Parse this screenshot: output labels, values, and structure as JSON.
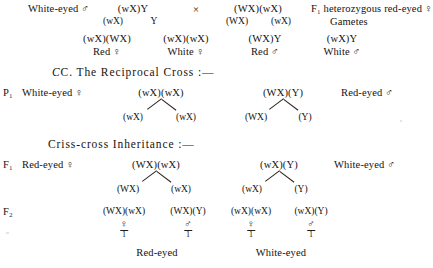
{
  "figure": {
    "caption_c": "C. The Reciprocal Cross :—",
    "caption_crisscross": "Criss-cross Inheritance :—",
    "symbols": {
      "male": "♂",
      "female": "♀",
      "cross": "×"
    }
  },
  "section_b_tail": {
    "parent_left_label": "White-eyed ♂",
    "parent_left_genotype": "(wX)Y",
    "parent_left_gametes": [
      "(wX)",
      "Y"
    ],
    "cross_symbol": "×",
    "parent_right_genotype": "(WX)(wX)",
    "parent_right_gametes": [
      "(WX)",
      "(wX)"
    ],
    "parent_right_label_line1": "F₁ heterozygous red-eyed ♀",
    "parent_right_label_line2": "Gametes",
    "offspring": [
      {
        "genotype": "(wX)(WX)",
        "phenotype": "Red ♀"
      },
      {
        "genotype": "(wX)(wX)",
        "phenotype": "White ♀"
      },
      {
        "genotype": "(WX)Y",
        "phenotype": "Red ♂"
      },
      {
        "genotype": "(wX)Y",
        "phenotype": "White ♂"
      }
    ]
  },
  "section_c": {
    "p1_row": {
      "generation_label": "P₁",
      "left_label": "White-eyed ♀",
      "left_genotype": "(wX)(wX)",
      "left_gametes": [
        "(wX)",
        "(wX)"
      ],
      "right_genotype": "(WX)(Y)",
      "right_gametes": [
        "(WX)",
        "(Y)"
      ],
      "right_label": "Red-eyed ♂"
    },
    "f1_row": {
      "generation_label": "F₁",
      "left_label": "Red-eyed ♀",
      "left_genotype": "(WX)(wX)",
      "left_gametes": [
        "(WX)",
        "(wX)"
      ],
      "right_genotype": "(wX)(Y)",
      "right_gametes": [
        "(wX)",
        "(Y)"
      ],
      "right_label": "White-eyed ♂"
    },
    "f2_row": {
      "generation_label": "F₂",
      "offspring": [
        {
          "genotype": "(WX)(wX)",
          "sex": "♀",
          "ratio": "1"
        },
        {
          "genotype": "(WX)(Y)",
          "sex": "♂",
          "ratio": "1"
        },
        {
          "genotype": "(wX)(wX)",
          "sex": "♀",
          "ratio": "1"
        },
        {
          "genotype": "(wX)(Y)",
          "sex": "♂",
          "ratio": "1"
        }
      ],
      "phenotype_left": "Red-eyed",
      "phenotype_right": "White-eyed"
    }
  }
}
